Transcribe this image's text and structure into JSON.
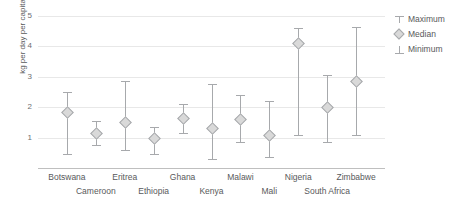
{
  "chart_data": {
    "type": "line",
    "title": "",
    "xlabel": "",
    "ylabel": "kg per day per capita",
    "ylim": [
      0,
      5
    ],
    "yticks": [
      1,
      2,
      3,
      4,
      5
    ],
    "grid": true,
    "legend_position": "right",
    "categories": [
      "Botswana",
      "Cameroon",
      "Eritrea",
      "Ethiopia",
      "Ghana",
      "Kenya",
      "Malawi",
      "Mali",
      "Nigeria",
      "South Africa",
      "Zimbabwe"
    ],
    "series": [
      {
        "name": "Maximum",
        "values": [
          2.5,
          1.55,
          2.85,
          1.35,
          2.1,
          2.75,
          2.4,
          2.2,
          4.6,
          3.05,
          4.65
        ]
      },
      {
        "name": "Median",
        "values": [
          1.85,
          1.15,
          1.5,
          1.0,
          1.65,
          1.3,
          1.6,
          1.1,
          4.1,
          2.0,
          2.85
        ]
      },
      {
        "name": "Minimum",
        "values": [
          0.45,
          0.75,
          0.6,
          0.45,
          1.15,
          0.3,
          0.85,
          0.35,
          1.1,
          0.85,
          1.1
        ]
      }
    ],
    "points": [
      {
        "category": "Botswana",
        "min": 0.45,
        "median": 1.85,
        "max": 2.5
      },
      {
        "category": "Cameroon",
        "min": 0.75,
        "median": 1.15,
        "max": 1.55
      },
      {
        "category": "Eritrea",
        "min": 0.6,
        "median": 1.5,
        "max": 2.85
      },
      {
        "category": "Ethiopia",
        "min": 0.45,
        "median": 1.0,
        "max": 1.35
      },
      {
        "category": "Ghana",
        "min": 1.15,
        "median": 1.65,
        "max": 2.1
      },
      {
        "category": "Kenya",
        "min": 0.3,
        "median": 1.3,
        "max": 2.75
      },
      {
        "category": "Malawi",
        "min": 0.85,
        "median": 1.6,
        "max": 2.4
      },
      {
        "category": "Mali",
        "min": 0.35,
        "median": 1.1,
        "max": 2.2
      },
      {
        "category": "Nigeria",
        "min": 1.1,
        "median": 4.1,
        "max": 4.6
      },
      {
        "category": "South Africa",
        "min": 0.85,
        "median": 2.0,
        "max": 3.05
      },
      {
        "category": "Zimbabwe",
        "min": 1.1,
        "median": 2.85,
        "max": 4.65
      }
    ]
  },
  "axis": {
    "y_title": "kg per day per capita",
    "y_tick_labels": [
      "5",
      "4",
      "3",
      "2",
      "1"
    ]
  },
  "legend": {
    "items": [
      {
        "label": "Maximum",
        "icon": "max-cap-icon",
        "color": "#a7a9ac"
      },
      {
        "label": "Median",
        "icon": "diamond-icon",
        "color": "#d9d9d9"
      },
      {
        "label": "Minimum",
        "icon": "min-cap-icon",
        "color": "#a7a9ac"
      }
    ]
  },
  "colors": {
    "line": "#a7a9ac",
    "marker_fill": "#d9d9d9",
    "grid": "#e8e8e8",
    "axis": "#bfbfbf",
    "text": "#58595b"
  }
}
